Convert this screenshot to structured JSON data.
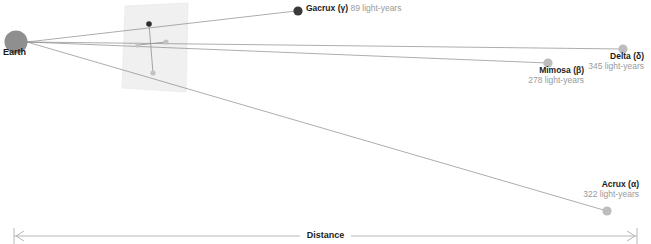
{
  "diagram": {
    "observer": {
      "label": "Earth",
      "color": "#8f8f8f"
    },
    "axis": {
      "label": "Distance",
      "color": "#b0b0b0"
    },
    "plane": {
      "name": "projection-plane",
      "color": "#efefef"
    },
    "stars": [
      {
        "key": "gacrux",
        "name": "Gacrux (γ)",
        "distance": "89 light-years",
        "color": "#3a3a3a"
      },
      {
        "key": "mimosa",
        "name": "Mimosa (β)",
        "distance": "278 light-years",
        "color": "#bdbdbd"
      },
      {
        "key": "delta",
        "name": "Delta (δ)",
        "distance": "345 light-years",
        "color": "#bdbdbd"
      },
      {
        "key": "acrux",
        "name": "Acrux (α)",
        "distance": "322 light-years",
        "color": "#bdbdbd"
      }
    ]
  }
}
